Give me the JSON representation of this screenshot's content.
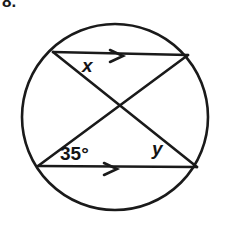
{
  "problem": {
    "number_label": "8."
  },
  "figure": {
    "type": "circle-with-chords",
    "stroke_color": "#1a1a1a",
    "background_color": "#ffffff",
    "circle": {
      "center_x": 115,
      "center_y": 117,
      "radius": 93
    },
    "points": {
      "top_left": {
        "x": 53,
        "y": 52,
        "name": "A"
      },
      "top_right": {
        "x": 188,
        "y": 55,
        "name": "B"
      },
      "bottom_left": {
        "x": 38,
        "y": 166,
        "name": "C"
      },
      "bottom_right": {
        "x": 197,
        "y": 167,
        "name": "D"
      },
      "intersection": {
        "x": 118,
        "y": 110,
        "name": "E"
      }
    },
    "chords": [
      {
        "name": "top-chord",
        "from": "top_left",
        "to": "top_right",
        "marked_parallel": true,
        "arrow_marks": 1
      },
      {
        "name": "bottom-chord",
        "from": "bottom_left",
        "to": "bottom_right",
        "marked_parallel": true,
        "arrow_marks": 1
      },
      {
        "name": "diagonal-chord-a",
        "from": "top_left",
        "to": "bottom_right",
        "marked_parallel": false,
        "arrow_marks": 0
      },
      {
        "name": "diagonal-chord-b",
        "from": "top_right",
        "to": "bottom_left",
        "marked_parallel": false,
        "arrow_marks": 0
      }
    ],
    "parallel_arrow_top": {
      "x": 110,
      "y": 56,
      "size": 13
    },
    "parallel_arrow_bottom": {
      "x": 104,
      "y": 169,
      "size": 13
    }
  },
  "labels": {
    "x": "x",
    "y": "y",
    "angle": "35°"
  }
}
